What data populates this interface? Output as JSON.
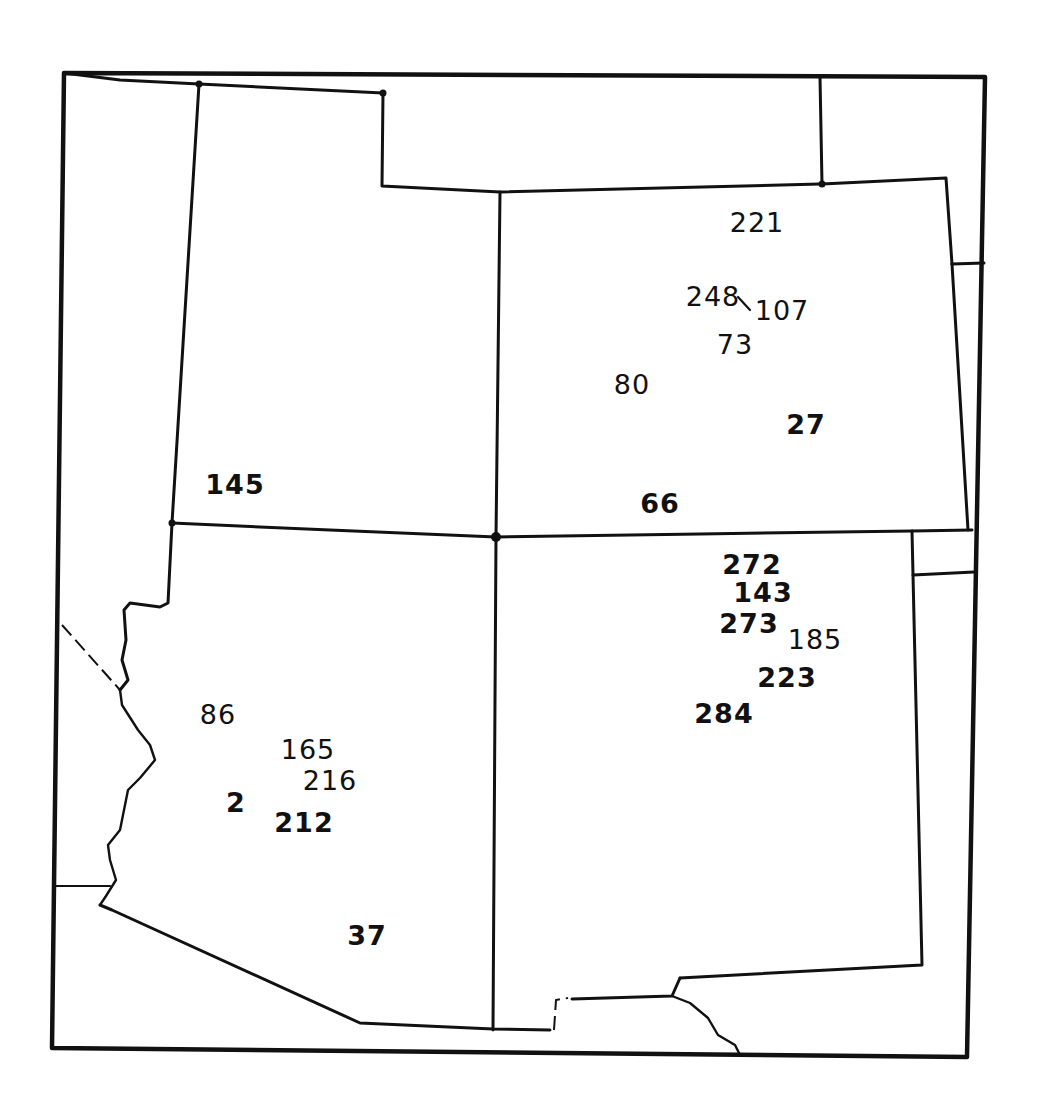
{
  "map": {
    "type": "hand-drawn regional outline map",
    "regions": [
      {
        "id": "nevada",
        "name": "Nevada (partial)"
      },
      {
        "id": "utah",
        "name": "Utah"
      },
      {
        "id": "colorado",
        "name": "Colorado"
      },
      {
        "id": "arizona",
        "name": "Arizona"
      },
      {
        "id": "new-mexico",
        "name": "New Mexico"
      },
      {
        "id": "wyoming",
        "name": "Wyoming (partial)"
      },
      {
        "id": "idaho",
        "name": "Idaho (partial)"
      },
      {
        "id": "nebraska",
        "name": "Nebraska (partial)"
      },
      {
        "id": "kansas",
        "name": "Kansas (partial)"
      },
      {
        "id": "oklahoma",
        "name": "Oklahoma panhandle (partial)"
      },
      {
        "id": "texas",
        "name": "Texas (partial)"
      },
      {
        "id": "california",
        "name": "California (partial)"
      },
      {
        "id": "mexico",
        "name": "Mexico (partial)"
      }
    ],
    "site_labels": [
      {
        "id": "s221",
        "text": "221",
        "x": 757,
        "y": 222,
        "region": "colorado"
      },
      {
        "id": "s248",
        "text": "248",
        "x": 713,
        "y": 296,
        "region": "colorado"
      },
      {
        "id": "s107",
        "text": "107",
        "x": 782,
        "y": 310,
        "region": "colorado"
      },
      {
        "id": "s73",
        "text": "73",
        "x": 735,
        "y": 344,
        "region": "colorado"
      },
      {
        "id": "s80",
        "text": "80",
        "x": 632,
        "y": 384,
        "region": "colorado"
      },
      {
        "id": "s27",
        "text": "27",
        "x": 806,
        "y": 424,
        "region": "colorado",
        "bold": true
      },
      {
        "id": "s66",
        "text": "66",
        "x": 660,
        "y": 503,
        "region": "colorado",
        "bold": true
      },
      {
        "id": "s145",
        "text": "145",
        "x": 235,
        "y": 484,
        "region": "utah",
        "bold": true
      },
      {
        "id": "s272",
        "text": "272",
        "x": 752,
        "y": 564,
        "region": "new-mexico",
        "bold": true
      },
      {
        "id": "s143",
        "text": "143",
        "x": 763,
        "y": 592,
        "region": "new-mexico",
        "bold": true
      },
      {
        "id": "s273",
        "text": "273",
        "x": 749,
        "y": 623,
        "region": "new-mexico",
        "bold": true
      },
      {
        "id": "s185",
        "text": "185",
        "x": 815,
        "y": 639,
        "region": "new-mexico"
      },
      {
        "id": "s223",
        "text": "223",
        "x": 787,
        "y": 677,
        "region": "new-mexico",
        "bold": true
      },
      {
        "id": "s284",
        "text": "284",
        "x": 724,
        "y": 713,
        "region": "new-mexico",
        "bold": true
      },
      {
        "id": "s86",
        "text": "86",
        "x": 218,
        "y": 714,
        "region": "arizona"
      },
      {
        "id": "s165",
        "text": "165",
        "x": 308,
        "y": 749,
        "region": "arizona"
      },
      {
        "id": "s216",
        "text": "216",
        "x": 330,
        "y": 780,
        "region": "arizona"
      },
      {
        "id": "s2",
        "text": "2",
        "x": 236,
        "y": 802,
        "region": "arizona",
        "bold": true
      },
      {
        "id": "s212",
        "text": "212",
        "x": 304,
        "y": 822,
        "region": "arizona",
        "bold": true
      },
      {
        "id": "s37",
        "text": "37",
        "x": 367,
        "y": 935,
        "region": "arizona",
        "bold": true
      }
    ]
  },
  "colors": {
    "ink": "#111111",
    "paper": "#ffffff"
  }
}
